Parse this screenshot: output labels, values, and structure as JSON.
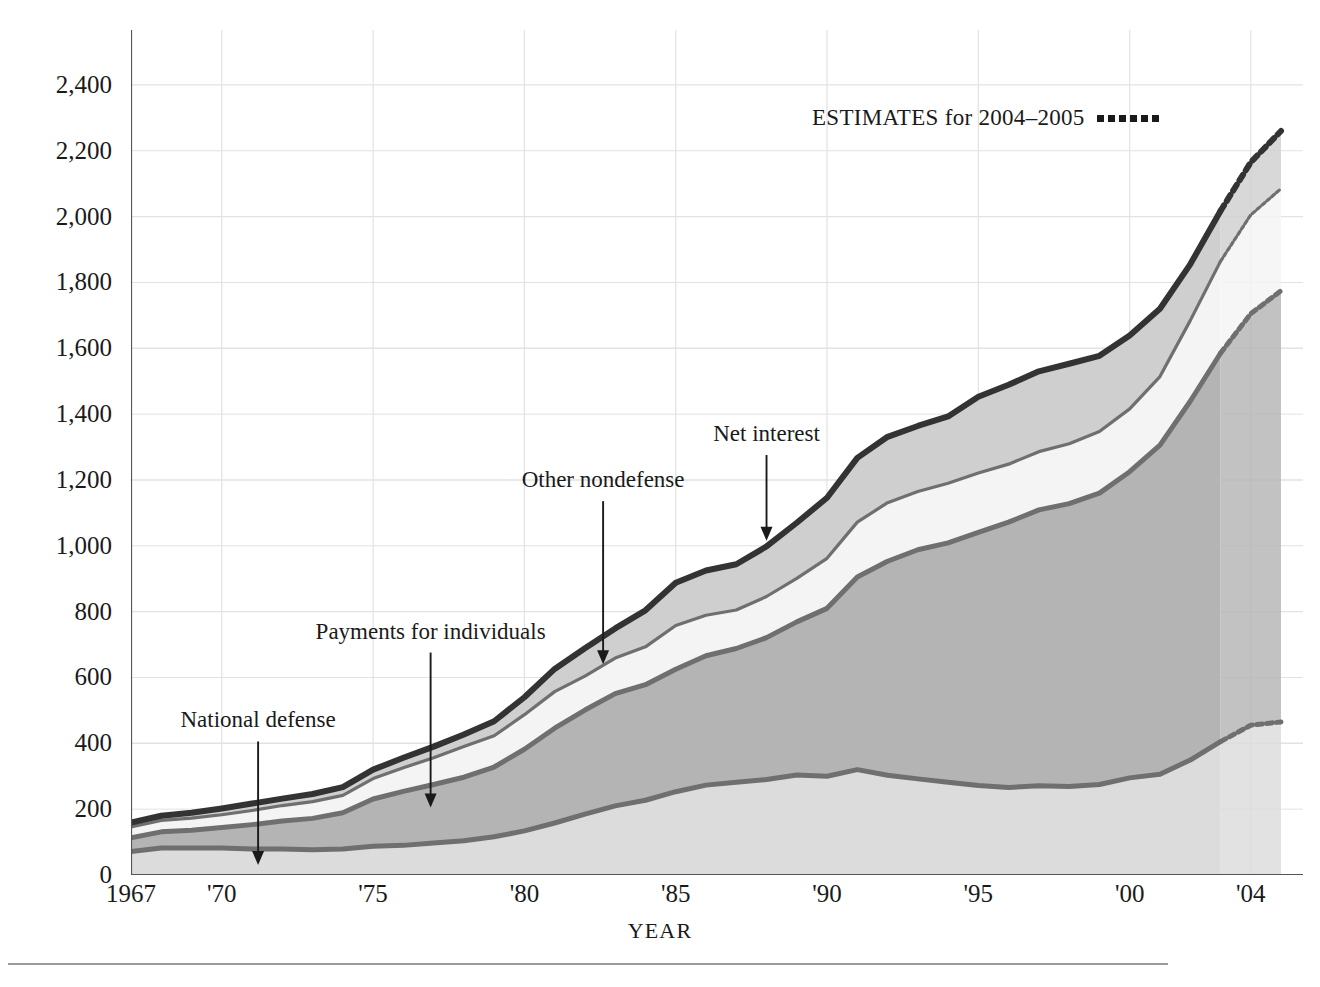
{
  "figure": {
    "top_clipped_text": "",
    "background": "#ffffff"
  },
  "axes": {
    "y_title": "BILLIONS OF DOLLARS",
    "x_title": "YEAR",
    "y_ticks": [
      "0",
      "200",
      "400",
      "600",
      "800",
      "1,000",
      "1,200",
      "1,400",
      "1,600",
      "1,800",
      "2,000",
      "2,200",
      "2,400"
    ],
    "x_ticks": [
      "1967",
      "'70",
      "'75",
      "'80",
      "'85",
      "'90",
      "'95",
      "'00",
      "'04"
    ]
  },
  "legend": {
    "label": "ESTIMATES for 2004–2005",
    "swatch": "dotted-line-sample"
  },
  "annotations": [
    {
      "label": "National defense",
      "series": "national_defense"
    },
    {
      "label": "Payments for individuals",
      "series": "payments_for_individuals"
    },
    {
      "label": "Other nondefense",
      "series": "other_nondefense"
    },
    {
      "label": "Net interest",
      "series": "net_interest"
    }
  ],
  "colors": {
    "national_defense_fill": "#dcdcdc",
    "payments_fill": "#b4b4b4",
    "other_nondefense_fill": "#f4f4f4",
    "net_interest_fill": "#cfcfcf",
    "boundary_line": "#6f6f6f",
    "total_line": "#333333",
    "grid": "#e2e2e2",
    "axis": "#555555"
  },
  "chart_data": {
    "type": "area",
    "xlabel": "YEAR",
    "ylabel": "BILLIONS OF DOLLARS",
    "xlim": [
      1967,
      2005
    ],
    "ylim": [
      0,
      2500
    ],
    "grid": true,
    "legend_position": "upper-right",
    "stacked": true,
    "estimate_years": [
      2004,
      2005
    ],
    "estimate_style": "dotted",
    "x": [
      1967,
      1968,
      1969,
      1970,
      1971,
      1972,
      1973,
      1974,
      1975,
      1976,
      1977,
      1978,
      1979,
      1980,
      1981,
      1982,
      1983,
      1984,
      1985,
      1986,
      1987,
      1988,
      1989,
      1990,
      1991,
      1992,
      1993,
      1994,
      1995,
      1996,
      1997,
      1998,
      1999,
      2000,
      2001,
      2002,
      2003,
      2004,
      2005
    ],
    "series": [
      {
        "name": "National defense",
        "key": "national_defense",
        "fill": "#dcdcdc",
        "values": [
          71,
          82,
          82,
          82,
          79,
          79,
          77,
          79,
          87,
          90,
          97,
          104,
          116,
          134,
          158,
          185,
          210,
          227,
          253,
          273,
          282,
          290,
          304,
          300,
          320,
          303,
          292,
          282,
          272,
          266,
          271,
          269,
          275,
          295,
          306,
          349,
          405,
          455,
          465
        ]
      },
      {
        "name": "Payments for individuals",
        "key": "payments_for_individuals",
        "fill": "#b4b4b4",
        "values": [
          42,
          49,
          54,
          62,
          74,
          85,
          95,
          110,
          144,
          164,
          178,
          193,
          212,
          248,
          288,
          316,
          341,
          351,
          372,
          393,
          406,
          431,
          465,
          510,
          585,
          650,
          696,
          727,
          769,
          806,
          838,
          859,
          885,
          930,
          1000,
          1090,
          1180,
          1250,
          1310
        ]
      },
      {
        "name": "Other nondefense",
        "key": "other_nondefense",
        "fill": "#f4f4f4",
        "values": [
          33,
          35,
          37,
          39,
          43,
          47,
          51,
          53,
          62,
          72,
          81,
          93,
          95,
          105,
          111,
          103,
          108,
          115,
          133,
          123,
          117,
          125,
          132,
          152,
          167,
          178,
          177,
          181,
          180,
          176,
          177,
          182,
          187,
          191,
          208,
          245,
          279,
          300,
          310
        ]
      },
      {
        "name": "Net interest",
        "key": "net_interest",
        "fill": "#cfcfcf",
        "values": [
          13,
          14,
          16,
          19,
          21,
          21,
          23,
          25,
          27,
          30,
          34,
          37,
          44,
          53,
          69,
          85,
          90,
          111,
          130,
          136,
          139,
          152,
          169,
          184,
          195,
          200,
          199,
          203,
          232,
          241,
          244,
          243,
          230,
          223,
          206,
          171,
          153,
          160,
          175
        ]
      }
    ],
    "totals": [
      159,
      180,
      189,
      202,
      217,
      232,
      246,
      267,
      320,
      356,
      390,
      427,
      467,
      540,
      626,
      689,
      749,
      804,
      888,
      925,
      944,
      998,
      1070,
      1146,
      1267,
      1331,
      1364,
      1393,
      1453,
      1489,
      1530,
      1553,
      1577,
      1639,
      1720,
      1855,
      2017,
      2165,
      2260
    ]
  }
}
